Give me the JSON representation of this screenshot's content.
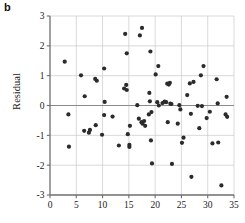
{
  "panel": {
    "label": "b"
  },
  "axes": {
    "ylabel": "Residual",
    "xlabel": "",
    "x_ticks": [
      "0",
      "5",
      "10",
      "15",
      "20",
      "25",
      "30",
      "35"
    ],
    "y_ticks": [
      "3",
      "2",
      "1",
      "0",
      "-1",
      "-2",
      "-3"
    ]
  },
  "chart_data": {
    "type": "scatter",
    "title": "",
    "xlabel": "",
    "ylabel": "Residual",
    "xlim": [
      0,
      35
    ],
    "ylim": [
      -3,
      3
    ],
    "xticks": [
      0,
      5,
      10,
      15,
      20,
      25,
      30,
      35
    ],
    "yticks": [
      -3,
      -2,
      -1,
      0,
      1,
      2,
      3
    ],
    "grid": true,
    "legend": "none",
    "reference_line_y": 0,
    "marker_color": "#2b2b2b",
    "marker_size": 2.1,
    "points": [
      [
        2.8,
        1.47
      ],
      [
        3.5,
        -0.3
      ],
      [
        3.6,
        -1.38
      ],
      [
        5.9,
        1.01
      ],
      [
        6.6,
        0.31
      ],
      [
        6.5,
        -0.85
      ],
      [
        7.4,
        -0.91
      ],
      [
        7.6,
        -0.82
      ],
      [
        8.6,
        0.89
      ],
      [
        8.9,
        0.83
      ],
      [
        8.7,
        -0.66
      ],
      [
        9.9,
        -0.98
      ],
      [
        10.3,
        1.24
      ],
      [
        10.4,
        0.12
      ],
      [
        10.3,
        -0.32
      ],
      [
        11.9,
        -0.37
      ],
      [
        13.1,
        -1.34
      ],
      [
        14.1,
        0.57
      ],
      [
        14.3,
        2.4
      ],
      [
        14.6,
        0.52
      ],
      [
        14.5,
        0.69
      ],
      [
        14.6,
        1.75
      ],
      [
        14.8,
        -0.96
      ],
      [
        15.1,
        -1.39
      ],
      [
        15.2,
        -0.68
      ],
      [
        15.1,
        -1.32
      ],
      [
        16.6,
        0.01
      ],
      [
        16.9,
        -0.44
      ],
      [
        17.1,
        2.35
      ],
      [
        17.5,
        2.6
      ],
      [
        17.4,
        -0.56
      ],
      [
        17.6,
        -0.61
      ],
      [
        17.9,
        -0.52
      ],
      [
        18.1,
        -0.68
      ],
      [
        18.9,
        0.42
      ],
      [
        18.8,
        -0.3
      ],
      [
        19.0,
        0.14
      ],
      [
        19.2,
        -1.17
      ],
      [
        19.3,
        -0.22
      ],
      [
        19.1,
        1.81
      ],
      [
        19.4,
        -1.94
      ],
      [
        20.1,
        1.04
      ],
      [
        20.4,
        0.11
      ],
      [
        20.6,
        1.32
      ],
      [
        20.7,
        0.0
      ],
      [
        21.4,
        0.08
      ],
      [
        21.8,
        0.13
      ],
      [
        22.1,
        0.11
      ],
      [
        22.3,
        0.73
      ],
      [
        22.4,
        -0.56
      ],
      [
        22.6,
        0.7
      ],
      [
        22.8,
        0.76
      ],
      [
        22.9,
        0.06
      ],
      [
        23.1,
        0.05
      ],
      [
        23.2,
        -1.96
      ],
      [
        24.3,
        -0.61
      ],
      [
        24.6,
        0.01
      ],
      [
        24.8,
        -0.13
      ],
      [
        25.1,
        -1.25
      ],
      [
        25.4,
        -1.08
      ],
      [
        26.1,
        0.35
      ],
      [
        26.6,
        0.74
      ],
      [
        26.8,
        -0.28
      ],
      [
        26.9,
        -2.39
      ],
      [
        27.3,
        0.79
      ],
      [
        28.1,
        -0.01
      ],
      [
        28.4,
        -0.76
      ],
      [
        28.7,
        1.01
      ],
      [
        28.9,
        -0.02
      ],
      [
        29.2,
        1.32
      ],
      [
        29.8,
        -0.42
      ],
      [
        30.4,
        -0.21
      ],
      [
        30.9,
        -1.27
      ],
      [
        31.7,
        0.88
      ],
      [
        31.9,
        0.07
      ],
      [
        32.0,
        -1.24
      ],
      [
        32.6,
        -2.68
      ],
      [
        33.4,
        -0.3
      ],
      [
        33.6,
        0.29
      ],
      [
        33.7,
        -0.38
      ]
    ]
  }
}
